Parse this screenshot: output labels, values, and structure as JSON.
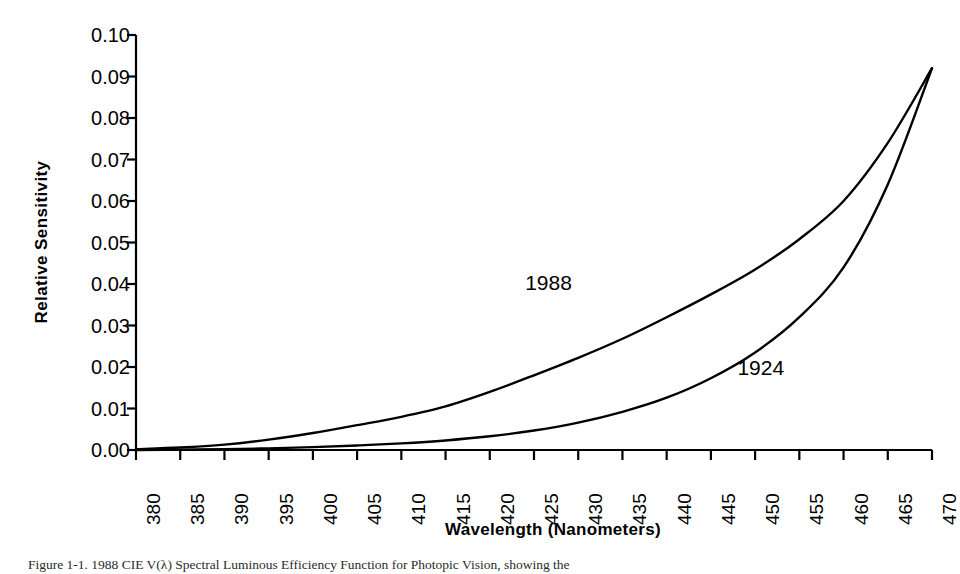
{
  "chart_data": {
    "type": "line",
    "title": "",
    "xlabel": "Wavelength (Nanometers)",
    "ylabel": "Relative Sensitivity",
    "xlim": [
      380,
      470
    ],
    "ylim": [
      0.0,
      0.1
    ],
    "grid": false,
    "legend_position": "inline-annotation",
    "xticks": [
      380,
      385,
      390,
      395,
      400,
      405,
      410,
      415,
      420,
      425,
      430,
      435,
      440,
      445,
      450,
      455,
      460,
      465,
      470
    ],
    "xtick_labels": [
      "380",
      "385",
      "390",
      "395",
      "400",
      "405",
      "410",
      "415",
      "420",
      "425",
      "430",
      "435",
      "440",
      "445",
      "450",
      "455",
      "460",
      "465",
      "470"
    ],
    "yticks": [
      0.0,
      0.01,
      0.02,
      0.03,
      0.04,
      0.05,
      0.06,
      0.07,
      0.08,
      0.09,
      0.1
    ],
    "ytick_labels": [
      "0.00",
      "0.01",
      "0.02",
      "0.03",
      "0.04",
      "0.05",
      "0.06",
      "0.07",
      "0.08",
      "0.09",
      "0.10"
    ],
    "x": [
      380,
      385,
      390,
      395,
      400,
      405,
      410,
      415,
      420,
      425,
      430,
      435,
      440,
      445,
      450,
      455,
      460,
      465,
      470
    ],
    "series": [
      {
        "name": "1988",
        "label": "1988",
        "color": "#000000",
        "values": [
          0.0002,
          0.0006,
          0.0013,
          0.0025,
          0.0041,
          0.006,
          0.008,
          0.0105,
          0.014,
          0.018,
          0.0222,
          0.0268,
          0.032,
          0.0375,
          0.0435,
          0.0508,
          0.06,
          0.074,
          0.092
        ],
        "annotation": {
          "text": "1988",
          "x": 424,
          "y": 0.043
        }
      },
      {
        "name": "1924",
        "label": "1924",
        "color": "#000000",
        "values": [
          0.0,
          0.0001,
          0.0002,
          0.0004,
          0.0007,
          0.0011,
          0.0016,
          0.0023,
          0.0033,
          0.0047,
          0.0066,
          0.0092,
          0.0126,
          0.0173,
          0.0235,
          0.032,
          0.044,
          0.064,
          0.092
        ],
        "annotation": {
          "text": "1924",
          "x": 448,
          "y": 0.0225
        }
      }
    ],
    "annotations": [
      {
        "name": "series-label-1988",
        "text": "1988"
      },
      {
        "name": "series-label-1924",
        "text": "1924"
      }
    ]
  },
  "caption": {
    "text": "Figure 1-1. 1988 CIE V(λ) Spectral Luminous Efficiency Function for Photopic Vision, showing the"
  },
  "axis_titles": {
    "x": "Wavelength (Nanometers)",
    "y": "Relative Sensitivity"
  }
}
